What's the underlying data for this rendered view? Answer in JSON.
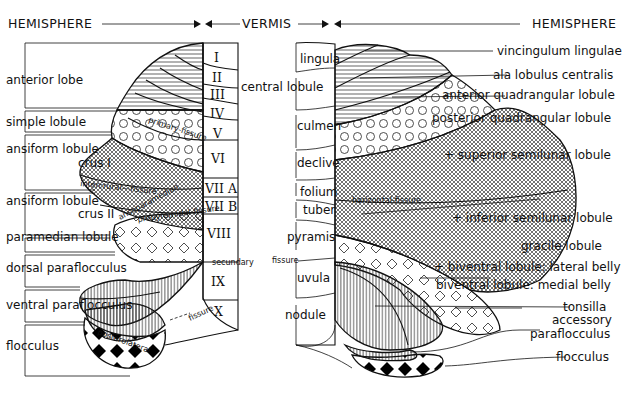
{
  "header": {
    "left": "HEMISPHERE",
    "center": "VERMIS",
    "right": "HEMISPHERE"
  },
  "left_labels": {
    "anterior_lobe": "anterior lobe",
    "simple_lobule": "simple lobule",
    "ansiform_1a": "ansiform lobule",
    "ansiform_1b": "crus I",
    "ansiform_2a": "ansiform lobule",
    "ansiform_2b": "crus II",
    "paramedian": "paramedian lobule",
    "dorsal_para": "dorsal paraflocculus",
    "ventral_para": "ventral paraflocculus",
    "flocculus": "flocculus"
  },
  "fissures_left": {
    "primary": "primary-fissure",
    "intercrural": "intercrural---fissure",
    "ansoparamedian": "ansoparamedian",
    "prepyramidal": "prepyramidal-fissure",
    "secundary": "secundary",
    "posterolateral": "posterolateral",
    "fissure": "fissure"
  },
  "vermis_lobules": [
    {
      "numeral": "I"
    },
    {
      "numeral": "II"
    },
    {
      "numeral": "III"
    },
    {
      "numeral": "IV"
    },
    {
      "numeral": "V"
    },
    {
      "numeral": "VI"
    },
    {
      "numeral": "VII A"
    },
    {
      "numeral": "VII B"
    },
    {
      "numeral": "VIII"
    },
    {
      "numeral": "IX"
    },
    {
      "numeral": "X"
    }
  ],
  "vermis_names": {
    "lingula": "lingula",
    "central_lobule": "central lobule",
    "culmen": "culmen",
    "declive": "declive",
    "folium": "folium",
    "tuber": "tuber",
    "pyramis": "pyramis",
    "fissure": "fissure",
    "uvula": "uvula",
    "nodule": "nodule"
  },
  "right_labels": {
    "vincingulum": "vincingulum lingulae",
    "ala": "ala lobulus centralis",
    "ant_quad": "anterior quadrangular lobule",
    "post_quad": "posterior quadrangular lobule",
    "sup_semilunar": "+ superior semilunar lobule",
    "horizontal": "horizontal-fissure",
    "inf_semilunar": "+ inferior semilunar lobule",
    "gracile": "gracile lobule",
    "biv_lat": "+ biventral lobule: lateral belly",
    "biv_med": "biventral lobule: medial belly",
    "tonsilla": "tonsilla",
    "accessory1": "accessory",
    "accessory2": "paraflocculus",
    "flocculus": "flocculus"
  }
}
